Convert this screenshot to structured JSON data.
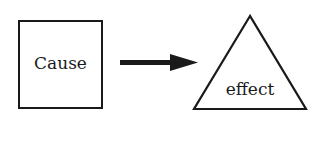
{
  "diagram": {
    "type": "cause-effect",
    "nodes": [
      {
        "id": "cause",
        "shape": "square",
        "label": "Cause"
      },
      {
        "id": "effect",
        "shape": "triangle",
        "label": "effect"
      }
    ],
    "edges": [
      {
        "from": "cause",
        "to": "effect",
        "style": "arrow"
      }
    ],
    "colors": {
      "stroke": "#1a1a1a",
      "background": "#ffffff"
    }
  }
}
